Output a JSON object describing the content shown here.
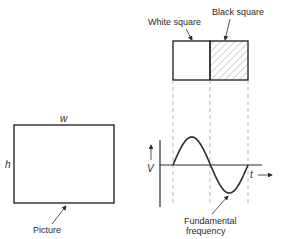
{
  "labels": {
    "white_square": "White square",
    "black_square": "Black square",
    "width_symbol": "w",
    "height_symbol": "h",
    "picture": "Picture",
    "voltage_symbol": "V",
    "time_symbol": "t",
    "fundamental_line1": "Fundamental",
    "fundamental_line2": "frequency"
  },
  "colors": {
    "ink": "#2a2a2a",
    "hatch": "#8a8a8a",
    "guide": "#9a9a9a"
  },
  "waveform": {
    "type": "sine",
    "cycles": 1,
    "description": "One cycle of a sine wave aligned beneath the white/black square pair"
  }
}
